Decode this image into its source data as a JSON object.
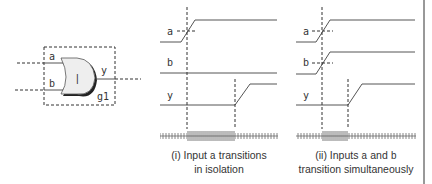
{
  "gate": {
    "type": "OR",
    "instance": "g1",
    "inputs": [
      "a",
      "b"
    ],
    "output": "y",
    "symbol": "|"
  },
  "panels": [
    {
      "id": "i",
      "signals": [
        "a",
        "b",
        "y"
      ],
      "caption_prefix": "(i) Input",
      "caption_var": "a",
      "caption_suffix": "transitions",
      "caption_line2": "in isolation"
    },
    {
      "id": "ii",
      "signals": [
        "a",
        "b",
        "y"
      ],
      "caption_prefix": "(ii) Inputs",
      "caption_var1": "a",
      "caption_mid": "and",
      "caption_var2": "b",
      "caption_line2": "transition simultaneously"
    }
  ],
  "colors": {
    "line": "#555555",
    "dashed": "#333333",
    "gate_fill": "#eeeeee",
    "text": "#333333"
  }
}
